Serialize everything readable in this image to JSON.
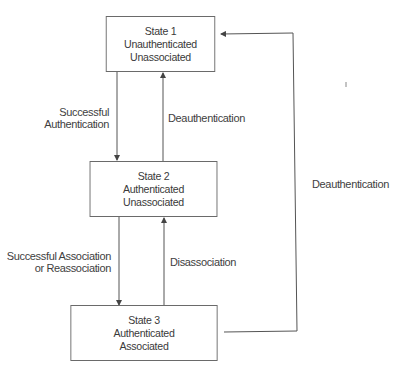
{
  "diagram": {
    "type": "state-diagram",
    "states": [
      {
        "id": "state1",
        "lines": [
          "State 1",
          "Unauthenticated",
          "Unassociated"
        ]
      },
      {
        "id": "state2",
        "lines": [
          "State 2",
          "Authenticated",
          "Unassociated"
        ]
      },
      {
        "id": "state3",
        "lines": [
          "State 3",
          "Authenticated",
          "Associated"
        ]
      }
    ],
    "transitions": [
      {
        "from": "state1",
        "to": "state2",
        "lines": [
          "Successful",
          "Authentication"
        ]
      },
      {
        "from": "state2",
        "to": "state1",
        "lines": [
          "Deauthentication"
        ]
      },
      {
        "from": "state2",
        "to": "state3",
        "lines": [
          "Successful Association",
          "or Reassociation"
        ]
      },
      {
        "from": "state3",
        "to": "state2",
        "lines": [
          "Disassociation"
        ]
      },
      {
        "from": "state3",
        "to": "state1",
        "lines": [
          "Deauthentication"
        ]
      }
    ],
    "line_color": "#555555"
  }
}
